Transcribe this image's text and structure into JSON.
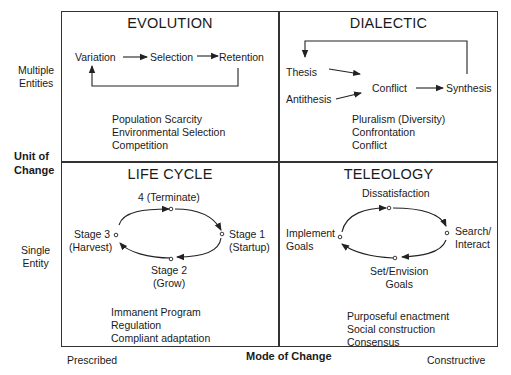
{
  "axes": {
    "y_title": [
      "Unit of",
      "Change"
    ],
    "y_top": [
      "Multiple",
      "Entities"
    ],
    "y_bottom": [
      "Single",
      "Entity"
    ],
    "x_title": "Mode of Change",
    "x_left": "Prescribed",
    "x_right": "Constructive"
  },
  "quadrants": {
    "evolution": {
      "title": "EVOLUTION",
      "flow": [
        "Variation",
        "Selection",
        "Retention"
      ],
      "properties": [
        "Population Scarcity",
        "Environmental Selection",
        "Competition"
      ]
    },
    "dialectic": {
      "title": "DIALECTIC",
      "nodes": [
        "Thesis",
        "Antithesis",
        "Conflict",
        "Synthesis"
      ],
      "properties": [
        "Pluralism (Diversity)",
        "Confrontation",
        "Conflict"
      ]
    },
    "life_cycle": {
      "title": "LIFE CYCLE",
      "stages": {
        "top": "4 (Terminate)",
        "right": [
          "Stage 1",
          "(Startup)"
        ],
        "bottom": [
          "Stage 2",
          "(Grow)"
        ],
        "left": [
          "Stage 3",
          "(Harvest)"
        ]
      },
      "properties": [
        "Immanent Program",
        "Regulation",
        "Compliant adaptation"
      ]
    },
    "teleology": {
      "title": "TELEOLOGY",
      "stages": {
        "top": "Dissatisfaction",
        "right": [
          "Search/",
          "Interact"
        ],
        "bottom": [
          "Set/Envision",
          "Goals"
        ],
        "left": [
          "Implement",
          "Goals"
        ]
      },
      "properties": [
        "Purposeful enactment",
        "Social construction",
        "Consensus"
      ]
    }
  }
}
